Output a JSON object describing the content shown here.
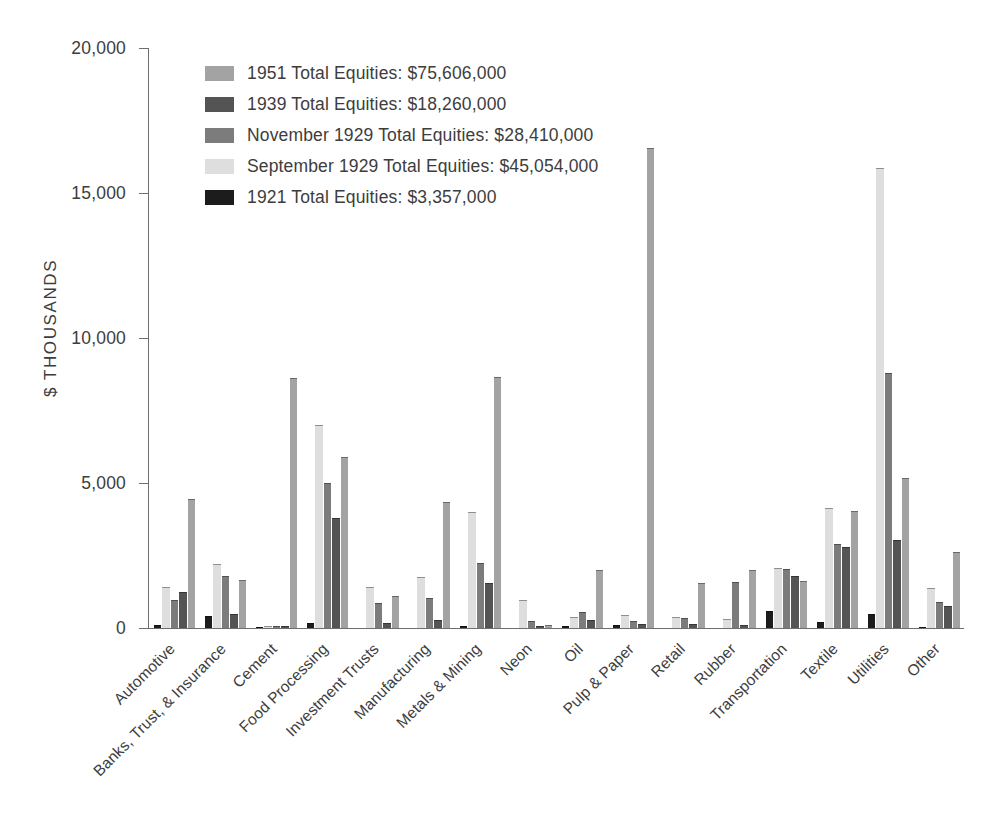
{
  "chart_data": {
    "type": "bar",
    "title": "",
    "subtitle": "",
    "xlabel": "",
    "ylabel": "$ THOUSANDS",
    "ylim": [
      0,
      20000
    ],
    "ytick_labels": [
      "0",
      "5,000",
      "10,000",
      "15,000",
      "20,000"
    ],
    "ytick_values": [
      0,
      5000,
      10000,
      15000,
      20000
    ],
    "grid": false,
    "legend_position": "upper-left-inside",
    "orientation": "vertical",
    "grouping": "grouped",
    "categories": [
      "Automotive",
      "Banks, Trust, & Insurance",
      "Cement",
      "Food Processing",
      "Investment Trusts",
      "Manufacturing",
      "Metals & Mining",
      "Neon",
      "Oil",
      "Pulp & Paper",
      "Retail",
      "Rubber",
      "Transportation",
      "Textile",
      "Utilities",
      "Other"
    ],
    "series": [
      {
        "name": "1921",
        "legend_label": "1921 Total Equities: $3,357,000",
        "total_equities": "$3,357,000",
        "color": "#1c1c1c",
        "values": [
          110,
          400,
          40,
          170,
          0,
          0,
          70,
          0,
          60,
          100,
          0,
          0,
          600,
          200,
          490,
          30
        ]
      },
      {
        "name": "September 1929",
        "legend_label": "September 1929 Total Equities: $45,054,000",
        "total_equities": "$45,054,000",
        "color": "#dedede",
        "values": [
          1400,
          2200,
          60,
          7000,
          1420,
          1750,
          4000,
          980,
          380,
          460,
          390,
          300,
          2080,
          4150,
          15850,
          1370
        ]
      },
      {
        "name": "November 1929",
        "legend_label": "November 1929 Total Equities: $28,410,000",
        "total_equities": "$28,410,000",
        "color": "#7c7c7c",
        "values": [
          950,
          1800,
          80,
          5000,
          870,
          1050,
          2250,
          230,
          550,
          250,
          330,
          1570,
          2020,
          2900,
          8800,
          900
        ]
      },
      {
        "name": "1939",
        "legend_label": "1939 Total Equities: $18,260,000",
        "total_equities": "$18,260,000",
        "color": "#545454",
        "values": [
          1250,
          500,
          70,
          3800,
          180,
          290,
          1550,
          80,
          290,
          130,
          140,
          120,
          1780,
          2800,
          3040,
          760
        ]
      },
      {
        "name": "1951",
        "legend_label": "1951 Total Equities: $75,606,000",
        "total_equities": "$75,606,000",
        "color": "#a3a3a3",
        "values": [
          4450,
          1650,
          8620,
          5890,
          1120,
          4330,
          8660,
          90,
          1990,
          16550,
          1560,
          2000,
          1630,
          4050,
          5190,
          2630
        ]
      }
    ]
  },
  "legend": {
    "entries": [
      {
        "label": "1951 Total Equities: $75,606,000",
        "color": "#a3a3a3"
      },
      {
        "label": "1939 Total Equities: $18,260,000",
        "color": "#545454"
      },
      {
        "label": "November 1929 Total Equities: $28,410,000",
        "color": "#7c7c7c"
      },
      {
        "label": "September 1929 Total Equities: $45,054,000",
        "color": "#dedede"
      },
      {
        "label": "1921 Total Equities: $3,357,000",
        "color": "#1c1c1c"
      }
    ]
  },
  "axis": {
    "y_title": "$ THOUSANDS",
    "y_ticks": [
      "20,000",
      "15,000",
      "10,000",
      "5,000",
      "0"
    ]
  },
  "colors": {
    "axis": "#6e6e6e",
    "text": "#3d3d3d",
    "background": "#ffffff"
  }
}
